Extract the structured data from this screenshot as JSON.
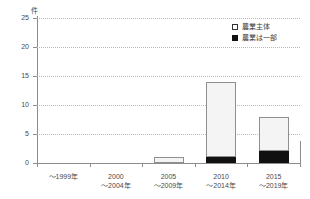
{
  "chart_data": {
    "type": "bar",
    "stacked": true,
    "title": "",
    "xlabel": "",
    "ylabel": "",
    "yunit": "件",
    "ylim": [
      0,
      25
    ],
    "yticks": [
      0,
      5,
      10,
      15,
      20,
      25
    ],
    "ytick_labels": [
      "0",
      "5",
      "10",
      "15",
      "20",
      "25"
    ],
    "grid": "horizontal-dotted",
    "legend_position": "top-right",
    "categories": [
      "〜1999年",
      "2000\n〜2004年",
      "2005\n〜2009年",
      "2010\n〜2014年",
      "2015\n〜2019年"
    ],
    "category_lines": [
      [
        "〜1999年",
        ""
      ],
      [
        "2000",
        "〜2004年"
      ],
      [
        "2005",
        "〜2009年"
      ],
      [
        "2010",
        "〜2014年"
      ],
      [
        "2015",
        "〜2019年"
      ]
    ],
    "series": [
      {
        "name": "農業は一部",
        "color": "#111111",
        "values": [
          0,
          0,
          0,
          1,
          2
        ]
      },
      {
        "name": "農業主体",
        "color": "#f4f4f4",
        "values": [
          0,
          0,
          1,
          13,
          6
        ]
      }
    ],
    "totals": [
      0,
      0,
      1,
      14,
      8
    ]
  },
  "legend": {
    "items": [
      {
        "label": "農業主体",
        "swatch": "white"
      },
      {
        "label": "農業は一部",
        "swatch": "black"
      }
    ]
  }
}
